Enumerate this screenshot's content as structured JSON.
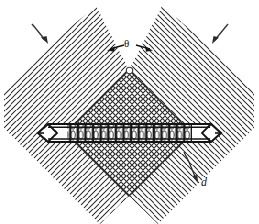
{
  "figure": {
    "title": "",
    "type": "technical-line-diagram",
    "background_color": "#ffffff",
    "ink_color": "#1a1a1a",
    "width": 259,
    "height": 224
  },
  "labels": {
    "angle_symbol": "θ",
    "spacing_symbol": "d"
  },
  "annotations": {
    "angle_arrow_left": "arrow-left-icon",
    "angle_arrow_right": "arrow-right-icon",
    "incoming_arrow_left": "arrow-down-right-icon",
    "incoming_arrow_right": "arrow-down-left-icon",
    "spacing_arrow": "arrow-down-right-icon"
  },
  "regions": {
    "left_arm": {
      "name": "left-hatched-arm",
      "hatch_direction": "down-right",
      "hatch_spacing_px": 11
    },
    "right_arm": {
      "name": "right-hatched-arm",
      "hatch_direction": "down-left",
      "hatch_spacing_px": 11
    },
    "center_diamond": {
      "name": "center-crosshatched-diamond",
      "hatch_direction": "cross",
      "hatch_spacing_px": 11
    },
    "horizontal_bar": {
      "name": "horizontal-striated-bar",
      "fill": "vertical-striations",
      "stripe_count": 23,
      "left_cap": "tapered",
      "right_cap": "tapered"
    }
  },
  "geometry": {
    "diamond_apex": [
      129,
      70
    ],
    "diamond_bottom": [
      129,
      196
    ],
    "diamond_left": [
      66,
      133
    ],
    "diamond_right": [
      192,
      133
    ],
    "bar_top_y": 124,
    "bar_bottom_y": 142,
    "bar_left_x": 38,
    "bar_right_x": 221
  }
}
